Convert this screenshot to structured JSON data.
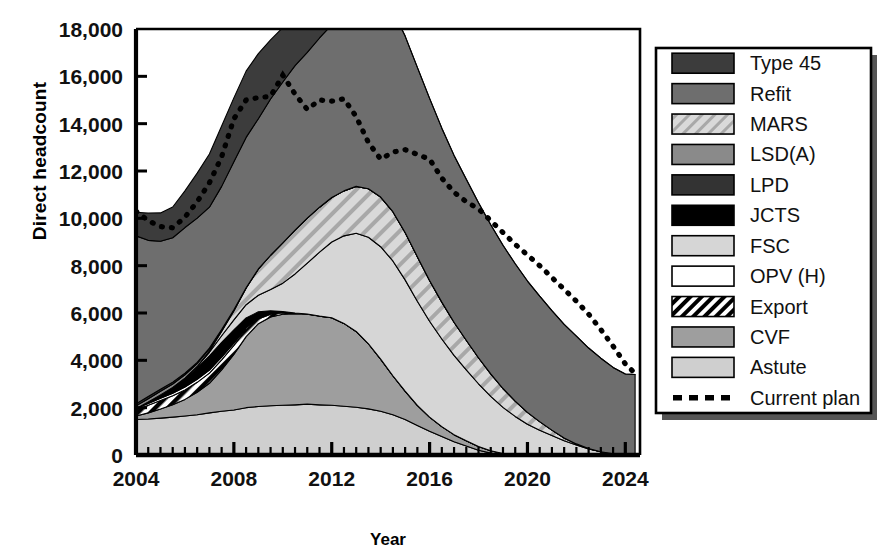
{
  "chart_data": {
    "type": "area",
    "stacked": true,
    "title": "",
    "xlabel": "Year",
    "ylabel": "Direct headcount",
    "xlim": [
      2004,
      2024.6
    ],
    "ylim": [
      0,
      18000
    ],
    "ytick_values": [
      0,
      2000,
      4000,
      6000,
      8000,
      10000,
      12000,
      14000,
      16000,
      18000
    ],
    "ytick_labels": [
      "0",
      "2,000",
      "4,000",
      "6,000",
      "8,000",
      "10,000",
      "12,000",
      "14,000",
      "16,000",
      "18,000"
    ],
    "xtick_values": [
      2004,
      2008,
      2012,
      2016,
      2020,
      2024
    ],
    "xtick_labels": [
      "2004",
      "2008",
      "2012",
      "2016",
      "2020",
      "2024"
    ],
    "x_minor_step": 0.5,
    "grid": false,
    "legend_position": "right-outside",
    "x": [
      2004.0,
      2004.5,
      2005.0,
      2005.5,
      2006.0,
      2006.5,
      2007.0,
      2007.5,
      2008.0,
      2008.5,
      2009.0,
      2009.5,
      2010.0,
      2010.5,
      2011.0,
      2011.5,
      2012.0,
      2012.5,
      2013.0,
      2013.5,
      2014.0,
      2014.5,
      2015.0,
      2015.5,
      2016.0,
      2016.5,
      2017.0,
      2017.5,
      2018.0,
      2018.5,
      2019.0,
      2019.5,
      2020.0,
      2020.5,
      2021.0,
      2021.5,
      2022.0,
      2022.5,
      2023.0,
      2023.5,
      2024.0,
      2024.4
    ],
    "stack_order_bottom_to_top": [
      "Astute",
      "CVF",
      "Export",
      "OPV (H)",
      "JCTS",
      "FSC",
      "MARS",
      "LSD(A)",
      "LPD",
      "Refit",
      "Type 45"
    ],
    "series": [
      {
        "name": "Astute",
        "values": [
          1500,
          1520,
          1560,
          1600,
          1650,
          1700,
          1780,
          1850,
          1900,
          2000,
          2050,
          2080,
          2100,
          2120,
          2150,
          2120,
          2100,
          2060,
          2020,
          1950,
          1850,
          1700,
          1500,
          1250,
          1000,
          780,
          560,
          380,
          200,
          80,
          0,
          0,
          0,
          0,
          0,
          0,
          0,
          0,
          0,
          0,
          0,
          0
        ]
      },
      {
        "name": "CVF",
        "values": [
          150,
          260,
          380,
          520,
          700,
          950,
          1250,
          1750,
          2350,
          3000,
          3500,
          3750,
          3850,
          3850,
          3800,
          3750,
          3700,
          3500,
          3200,
          2750,
          2200,
          1650,
          1200,
          850,
          600,
          420,
          300,
          220,
          160,
          100,
          60,
          30,
          0,
          0,
          0,
          0,
          0,
          0,
          0,
          0,
          0,
          0
        ]
      },
      {
        "name": "Export",
        "values": [
          250,
          320,
          360,
          380,
          400,
          420,
          430,
          420,
          380,
          300,
          200,
          120,
          60,
          30,
          10,
          0,
          0,
          0,
          0,
          0,
          0,
          0,
          0,
          0,
          0,
          0,
          0,
          0,
          0,
          0,
          0,
          0,
          0,
          0,
          0,
          0,
          0,
          0,
          0,
          0,
          0,
          0
        ]
      },
      {
        "name": "OPV (H)",
        "values": [
          60,
          80,
          100,
          110,
          120,
          130,
          130,
          120,
          100,
          70,
          40,
          20,
          10,
          0,
          0,
          0,
          0,
          0,
          0,
          0,
          0,
          0,
          0,
          0,
          0,
          0,
          0,
          0,
          0,
          0,
          0,
          0,
          0,
          0,
          0,
          0,
          0,
          0,
          0,
          0,
          0,
          0
        ]
      },
      {
        "name": "JCTS",
        "values": [
          0,
          60,
          140,
          240,
          360,
          480,
          600,
          620,
          560,
          420,
          260,
          120,
          40,
          0,
          0,
          0,
          0,
          0,
          0,
          0,
          0,
          0,
          0,
          0,
          0,
          0,
          0,
          0,
          0,
          0,
          0,
          0,
          0,
          0,
          0,
          0,
          0,
          0,
          0,
          0,
          0,
          0
        ]
      },
      {
        "name": "FSC",
        "values": [
          0,
          0,
          0,
          0,
          20,
          60,
          150,
          280,
          420,
          560,
          700,
          900,
          1200,
          1650,
          2150,
          2700,
          3200,
          3700,
          4150,
          4500,
          4750,
          4850,
          4700,
          4400,
          4050,
          3700,
          3350,
          3000,
          2650,
          2300,
          1950,
          1600,
          1300,
          1050,
          820,
          600,
          420,
          260,
          140,
          50,
          0,
          0
        ]
      },
      {
        "name": "MARS",
        "values": [
          0,
          0,
          0,
          0,
          0,
          0,
          60,
          180,
          380,
          700,
          1100,
          1450,
          1700,
          1850,
          1900,
          1900,
          1880,
          1900,
          1980,
          2050,
          2100,
          2080,
          2000,
          1880,
          1720,
          1560,
          1400,
          1250,
          1100,
          950,
          800,
          650,
          500,
          360,
          230,
          120,
          50,
          10,
          0,
          0,
          0,
          0
        ]
      },
      {
        "name": "LSD(A)",
        "values": [
          120,
          140,
          150,
          150,
          140,
          120,
          90,
          60,
          40,
          20,
          10,
          0,
          0,
          0,
          0,
          0,
          0,
          0,
          0,
          0,
          0,
          0,
          0,
          0,
          0,
          0,
          0,
          0,
          0,
          0,
          0,
          0,
          0,
          0,
          0,
          0,
          0,
          0,
          0,
          0,
          0,
          0
        ]
      },
      {
        "name": "LPD",
        "values": [
          80,
          90,
          90,
          80,
          70,
          50,
          30,
          20,
          10,
          0,
          0,
          0,
          0,
          0,
          0,
          0,
          0,
          0,
          0,
          0,
          0,
          0,
          0,
          0,
          0,
          0,
          0,
          0,
          0,
          0,
          0,
          0,
          0,
          0,
          0,
          0,
          0,
          0,
          0,
          0,
          0,
          0
        ]
      },
      {
        "name": "Refit",
        "values": [
          7100,
          6600,
          6250,
          6100,
          6150,
          6100,
          5950,
          6050,
          6250,
          6350,
          6350,
          6600,
          6800,
          6950,
          7000,
          7150,
          7300,
          7450,
          7550,
          7900,
          8300,
          8500,
          8300,
          8000,
          7700,
          7350,
          7050,
          6800,
          6550,
          6300,
          6050,
          5800,
          5550,
          5300,
          5050,
          4800,
          4550,
          4250,
          3950,
          3650,
          3420,
          3400
        ]
      },
      {
        "name": "Type 45",
        "values": [
          1000,
          1150,
          1200,
          1300,
          1550,
          1900,
          2250,
          2550,
          2700,
          2800,
          2750,
          2500,
          2300,
          2100,
          1600,
          900,
          350,
          100,
          20,
          0,
          0,
          0,
          0,
          0,
          0,
          0,
          0,
          0,
          0,
          0,
          0,
          0,
          0,
          0,
          0,
          0,
          0,
          0,
          0,
          0,
          0,
          0
        ]
      }
    ],
    "current_plan": {
      "name": "Current plan",
      "style": "dotted",
      "values": [
        10300,
        9900,
        9650,
        9600,
        10050,
        10700,
        11500,
        12600,
        14200,
        15000,
        15100,
        15150,
        16050,
        15250,
        14600,
        15000,
        14950,
        15050,
        14300,
        13200,
        12500,
        12800,
        12900,
        12700,
        12500,
        11700,
        11100,
        10700,
        10400,
        9900,
        9400,
        8900,
        8450,
        8000,
        7500,
        7000,
        6500,
        5950,
        5300,
        4600,
        3850,
        3450
      ]
    },
    "legend": [
      {
        "label": "Type 45",
        "fill": "#3c3c3c",
        "pattern": "solid"
      },
      {
        "label": "Refit",
        "fill": "#6e6e6e",
        "pattern": "solid"
      },
      {
        "label": "MARS",
        "fill": "#c9c9c9",
        "pattern": "diag-light"
      },
      {
        "label": "LSD(A)",
        "fill": "#8a8a8a",
        "pattern": "solid"
      },
      {
        "label": "LPD",
        "fill": "#333333",
        "pattern": "solid"
      },
      {
        "label": "JCTS",
        "fill": "#000000",
        "pattern": "solid"
      },
      {
        "label": "FSC",
        "fill": "#d6d6d6",
        "pattern": "solid"
      },
      {
        "label": "OPV (H)",
        "fill": "#ffffff",
        "pattern": "solid"
      },
      {
        "label": "Export",
        "fill": "#ffffff",
        "pattern": "diag-bold"
      },
      {
        "label": "CVF",
        "fill": "#9e9e9e",
        "pattern": "solid"
      },
      {
        "label": "Astute",
        "fill": "#cfcfcf",
        "pattern": "solid"
      },
      {
        "label": "Current plan",
        "fill": "none",
        "pattern": "dotted-line"
      }
    ]
  },
  "colors": {
    "axis": "#000000",
    "plot_border": "#000000",
    "legend_border": "#000000",
    "legend_shadow": "#555555",
    "background": "#ffffff"
  }
}
